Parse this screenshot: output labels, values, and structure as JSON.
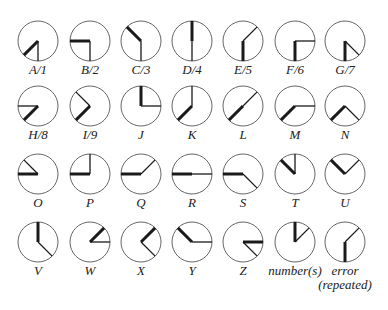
{
  "diagram": {
    "line_color": "#1a1a1a",
    "circle_color": "#555555",
    "layout": {
      "col_x": [
        38,
        90,
        141,
        192,
        243,
        295,
        345
      ],
      "row_y": [
        41,
        106,
        174,
        242
      ],
      "radius": 20,
      "label_offset": 31
    },
    "glyphs": [
      {
        "label": "A/1",
        "row": 0,
        "col": 0,
        "thick": 225,
        "thin": 180
      },
      {
        "label": "B/2",
        "row": 0,
        "col": 1,
        "thick": 270,
        "thin": 180
      },
      {
        "label": "C/3",
        "row": 0,
        "col": 2,
        "thick": 315,
        "thin": 180
      },
      {
        "label": "D/4",
        "row": 0,
        "col": 3,
        "thick": 0,
        "thin": 180
      },
      {
        "label": "E/5",
        "row": 0,
        "col": 4,
        "thick": 180,
        "thin": 45
      },
      {
        "label": "F/6",
        "row": 0,
        "col": 5,
        "thick": 180,
        "thin": 90
      },
      {
        "label": "G/7",
        "row": 0,
        "col": 6,
        "thick": 180,
        "thin": 135
      },
      {
        "label": "H/8",
        "row": 1,
        "col": 0,
        "thick": 225,
        "thin": 270
      },
      {
        "label": "I/9",
        "row": 1,
        "col": 1,
        "thick": 225,
        "thin": 315
      },
      {
        "label": "J",
        "row": 1,
        "col": 2,
        "thick": 0,
        "thin": 90
      },
      {
        "label": "K",
        "row": 1,
        "col": 3,
        "thick": 225,
        "thin": 0
      },
      {
        "label": "L",
        "row": 1,
        "col": 4,
        "thick": 225,
        "thin": 45
      },
      {
        "label": "M",
        "row": 1,
        "col": 5,
        "thick": 225,
        "thin": 90
      },
      {
        "label": "N",
        "row": 1,
        "col": 6,
        "thick": 225,
        "thin": 135
      },
      {
        "label": "O",
        "row": 2,
        "col": 0,
        "thick": 270,
        "thin": 315
      },
      {
        "label": "P",
        "row": 2,
        "col": 1,
        "thick": 270,
        "thin": 0
      },
      {
        "label": "Q",
        "row": 2,
        "col": 2,
        "thick": 270,
        "thin": 45
      },
      {
        "label": "R",
        "row": 2,
        "col": 3,
        "thick": 270,
        "thin": 90
      },
      {
        "label": "S",
        "row": 2,
        "col": 4,
        "thick": 270,
        "thin": 135
      },
      {
        "label": "T",
        "row": 2,
        "col": 5,
        "thick": 315,
        "thin": 0
      },
      {
        "label": "U",
        "row": 2,
        "col": 6,
        "thick": 315,
        "thin": 45
      },
      {
        "label": "V",
        "row": 3,
        "col": 0,
        "thick": 0,
        "thin": 135
      },
      {
        "label": "W",
        "row": 3,
        "col": 1,
        "thick": 45,
        "thin": 90
      },
      {
        "label": "X",
        "row": 3,
        "col": 2,
        "thick": 45,
        "thin": 135
      },
      {
        "label": "Y",
        "row": 3,
        "col": 3,
        "thick": 315,
        "thin": 90
      },
      {
        "label": "Z",
        "row": 3,
        "col": 4,
        "thick": 90,
        "thin": 135
      },
      {
        "label": "number(s)",
        "row": 3,
        "col": 5,
        "thick": 0,
        "thin": 45
      },
      {
        "label": "error (repeated)",
        "line1": "error",
        "line2": "(repeated)",
        "row": 3,
        "col": 6,
        "thick": 180,
        "thin": 45
      }
    ]
  }
}
